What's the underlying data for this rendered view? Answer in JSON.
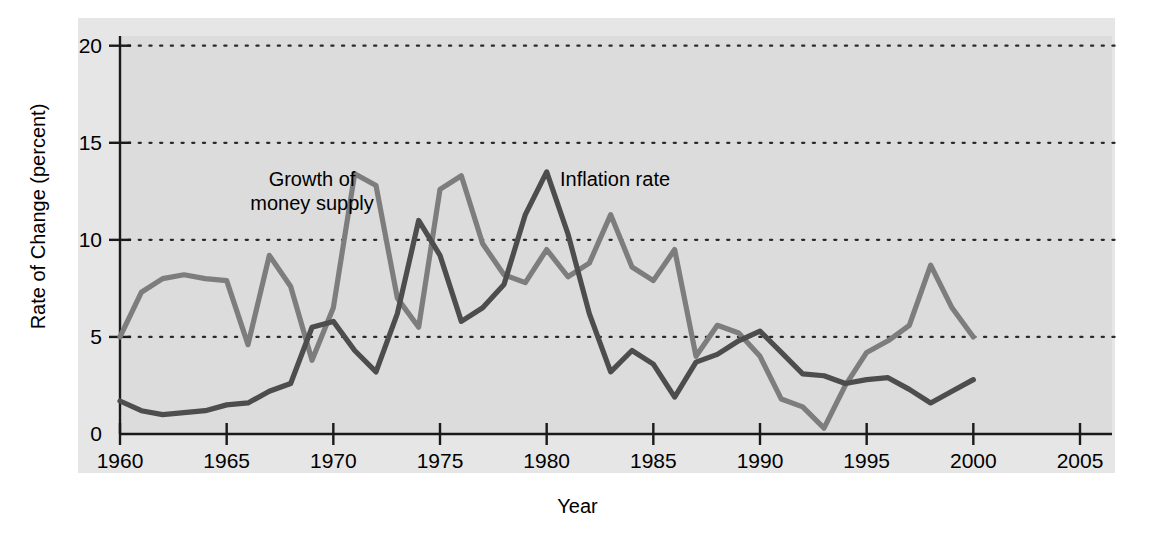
{
  "chart_data": {
    "type": "line",
    "title": "",
    "xlabel": "Year",
    "ylabel": "Rate of Change (percent)",
    "xlim": [
      1960,
      2006.5
    ],
    "ylim": [
      0,
      20.5
    ],
    "xticks": [
      1960,
      1965,
      1970,
      1975,
      1980,
      1985,
      1990,
      1995,
      2000,
      2005
    ],
    "xtick_labels": [
      "1960",
      "1965",
      "1970",
      "1975",
      "1980",
      "1985",
      "1990",
      "1995",
      "2000",
      "2005"
    ],
    "yticks": [
      0,
      5,
      10,
      15,
      20
    ],
    "ytick_labels": [
      "0",
      "5",
      "10",
      "15",
      "20"
    ],
    "grid": "horizontal-dotted",
    "legend_position": "inline-annotations",
    "x": [
      1960,
      1961,
      1962,
      1963,
      1964,
      1965,
      1966,
      1967,
      1968,
      1969,
      1970,
      1971,
      1972,
      1973,
      1974,
      1975,
      1976,
      1977,
      1978,
      1979,
      1980,
      1981,
      1982,
      1983,
      1984,
      1985,
      1986,
      1987,
      1988,
      1989,
      1990,
      1991,
      1992,
      1993,
      1994,
      1995,
      1996,
      1997,
      1998,
      1999,
      2000
    ],
    "series": [
      {
        "name": "Growth of money supply",
        "color": "#7d7d7d",
        "values": [
          5.0,
          7.3,
          8.0,
          8.2,
          8.0,
          7.9,
          4.6,
          9.2,
          7.6,
          3.8,
          6.5,
          13.4,
          12.8,
          7.0,
          5.5,
          12.6,
          13.3,
          9.8,
          8.2,
          7.8,
          9.5,
          8.1,
          8.8,
          11.3,
          8.6,
          7.9,
          9.5,
          4.0,
          5.6,
          5.2,
          4.0,
          1.8,
          1.4,
          0.3,
          2.5,
          4.2,
          4.8,
          5.6,
          8.7,
          6.5,
          5.0
        ]
      },
      {
        "name": "Inflation rate",
        "color": "#4d4d4d",
        "values": [
          1.7,
          1.2,
          1.0,
          1.1,
          1.2,
          1.5,
          1.6,
          2.2,
          2.6,
          5.5,
          5.8,
          4.3,
          3.2,
          6.2,
          11.0,
          9.2,
          5.8,
          6.5,
          7.7,
          11.3,
          13.5,
          10.3,
          6.2,
          3.2,
          4.3,
          3.6,
          1.9,
          3.7,
          4.1,
          4.8,
          5.3,
          4.2,
          3.1,
          3.0,
          2.6,
          2.8,
          2.9,
          2.3,
          1.6,
          2.2,
          2.8
        ]
      }
    ]
  },
  "annotations": {
    "money_supply": "Growth of\nmoney supply",
    "inflation": "Inflation rate"
  },
  "colors": {
    "panel_background": "#e6e6e6",
    "plot_background": "#dcdcdc",
    "axis": "#1a1a1a",
    "gridline": "#2b2b2b",
    "money_supply_line": "#7d7d7d",
    "inflation_line": "#4d4d4d"
  }
}
